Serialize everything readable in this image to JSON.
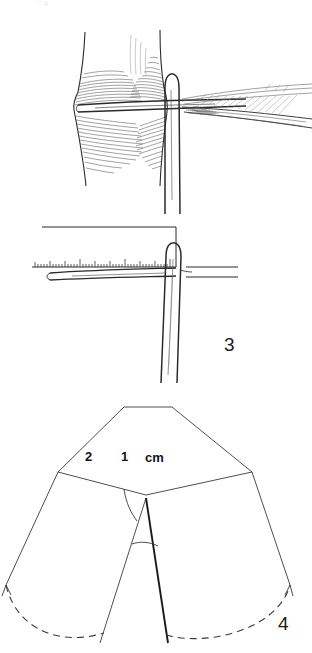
{
  "page": {
    "width": 312,
    "height": 653,
    "background": "#ffffff",
    "ink_color": "#2a2a2a"
  },
  "top_edge": {
    "artifact_marks": "'   '   ="
  },
  "figures": [
    {
      "id": "figure-2-top",
      "number_label": "",
      "caption": "",
      "type": "hatched-anatomical-illustration",
      "description": "Cross-hatched tissue column with horizontal instrument passing through and fan of fine lines to the right"
    },
    {
      "id": "figure-3-middle",
      "number_label": "3",
      "caption": "",
      "type": "ruler-measurement-illustration",
      "ruler": {
        "unit_label": "cm",
        "major_ticks": [
          "2",
          "1"
        ],
        "tick_count": 44
      },
      "description": "Scale bar measuring length of a needle/probe held vertically"
    },
    {
      "id": "figure-4-bottom",
      "number_label": "4",
      "caption": "",
      "type": "geometric-diagram",
      "vertex_labels": [
        "A",
        "B",
        "C",
        "E",
        "D",
        "F",
        "R"
      ],
      "angle_label": "α",
      "description": "Flap geometry outline with vertices A B C on top edge, E and F at the sides, D at centre with radius R and apex angle alpha, and two dashed arcs at the base"
    }
  ],
  "labels": {
    "A": "A",
    "B": "B",
    "C": "C",
    "D": "D",
    "E": "E",
    "F": "F",
    "R": "R",
    "alpha": "α",
    "cm": "cm",
    "two": "2",
    "one": "1",
    "fig3": "3",
    "fig4": "4"
  }
}
